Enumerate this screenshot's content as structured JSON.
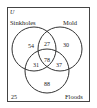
{
  "diagram": {
    "type": "venn-3",
    "universe_label": "U",
    "sets": [
      {
        "name": "Sinkholes"
      },
      {
        "name": "Mold"
      },
      {
        "name": "Floods"
      }
    ],
    "regions": {
      "sinkholes_only": "54",
      "sinkholes_mold_only": "27",
      "mold_only": "30",
      "all_three": "78",
      "sinkholes_floods_only": "31",
      "mold_floods_only": "37",
      "floods_only": "88",
      "none": "25"
    }
  }
}
